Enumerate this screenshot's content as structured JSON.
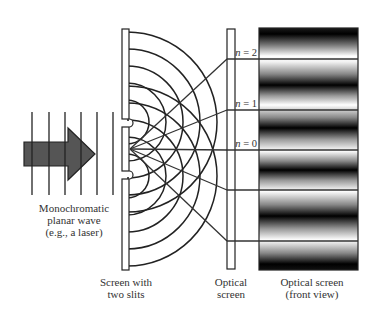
{
  "figure": {
    "type": "double-slit interference diagram",
    "source_label": [
      "Monochromatic",
      "planar wave",
      "(e.g., a laser)"
    ],
    "slit_screen_label": [
      "Screen with",
      "two slits"
    ],
    "optical_screen_label": [
      "Optical",
      "screen"
    ],
    "front_view_label": [
      "Optical screen",
      "(front view)"
    ],
    "orders": [
      {
        "symbol": "n",
        "value": " = 2"
      },
      {
        "symbol": "n",
        "value": " = 1"
      },
      {
        "symbol": "n",
        "value": " = 0"
      }
    ]
  },
  "colors": {
    "background": "#ffffff",
    "line": "#222222",
    "arrow_fill": "#555555",
    "text": "#333333"
  }
}
